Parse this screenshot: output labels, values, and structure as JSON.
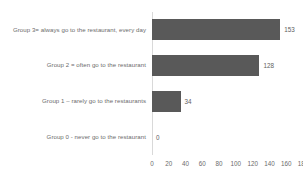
{
  "chart_data": {
    "type": "bar",
    "orientation": "horizontal",
    "title": "",
    "xlabel": "",
    "ylabel": "",
    "xlim": [
      0,
      180
    ],
    "grid": false,
    "legend": false,
    "bar_color": "#595959",
    "text_color": "#6b6b6b",
    "axis_color": "#d9d9d9",
    "background": "#ffffff",
    "ticks": [
      0,
      20,
      40,
      60,
      80,
      100,
      120,
      140,
      160,
      180
    ],
    "tick_labels": [
      "0",
      "20",
      "40",
      "60",
      "80",
      "100",
      "120",
      "140",
      "160",
      "180"
    ],
    "categories": [
      "Group 3= always go to the restaurant, every day",
      "Group 2 = often go to the restaurant",
      "Group 1 – rarely go to the restaurants",
      "Group 0 -  never go to the restaurant"
    ],
    "values": [
      153,
      128,
      34,
      0
    ],
    "value_labels": [
      "153",
      "128",
      "34",
      "0"
    ]
  }
}
